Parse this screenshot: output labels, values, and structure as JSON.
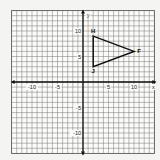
{
  "chart_data": {
    "type": "scatter",
    "title": "",
    "xlabel": "x",
    "ylabel": "y",
    "xlim": [
      -14,
      14
    ],
    "ylim": [
      -14,
      14
    ],
    "grid": true,
    "x_ticks": [
      -10,
      -5,
      5,
      10
    ],
    "y_ticks": [
      10,
      5,
      -5,
      -10
    ],
    "tick_labels": {
      "x": [
        "-10",
        "-5",
        "5",
        "10"
      ],
      "y": [
        "10",
        "5",
        "-5",
        "-10"
      ]
    },
    "shapes": [
      {
        "type": "triangle",
        "vertices": [
          {
            "label": "H",
            "x": 2,
            "y": 9
          },
          {
            "label": "F",
            "x": 10,
            "y": 6
          },
          {
            "label": "J",
            "x": 2,
            "y": 3
          }
        ]
      }
    ]
  },
  "labels": {
    "x_axis": "x",
    "y_axis": "y",
    "H": "H",
    "F": "F",
    "J": "J"
  }
}
